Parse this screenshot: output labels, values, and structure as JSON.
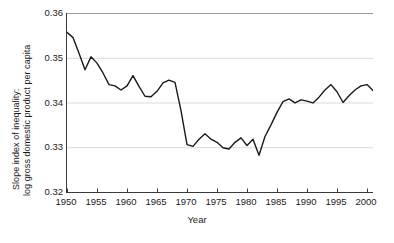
{
  "chart_data": {
    "type": "line",
    "title": "",
    "xlabel": "Year",
    "ylabel_lines": [
      "Slope index of inequality:",
      "log gross domestic product per capita"
    ],
    "ylabel": "Slope index of inequality: log gross domestic product per capita",
    "xlim": [
      1950,
      2001
    ],
    "ylim": [
      0.32,
      0.36
    ],
    "xticks": [
      1950,
      1955,
      1960,
      1965,
      1970,
      1975,
      1980,
      1985,
      1990,
      1995,
      2000
    ],
    "xtick_labels": [
      "1950",
      "1955",
      "1960",
      "1965",
      "1970",
      "1975",
      "1980",
      "1985",
      "1990",
      "1995",
      "2000"
    ],
    "yticks": [
      0.32,
      0.33,
      0.34,
      0.35,
      0.36
    ],
    "ytick_labels": [
      "0.32",
      "0.33",
      "0.34",
      "0.35",
      "0.36"
    ],
    "grid": "horizontal",
    "grid_color": "#d9d9d9",
    "legend": "none",
    "line_color": "#1a1a1a",
    "line_width": 1.4,
    "x": [
      1950,
      1951,
      1952,
      1953,
      1954,
      1955,
      1956,
      1957,
      1958,
      1959,
      1960,
      1961,
      1962,
      1963,
      1964,
      1965,
      1966,
      1967,
      1968,
      1969,
      1970,
      1971,
      1972,
      1973,
      1974,
      1975,
      1976,
      1977,
      1978,
      1979,
      1980,
      1981,
      1982,
      1983,
      1984,
      1985,
      1986,
      1987,
      1988,
      1989,
      1990,
      1991,
      1992,
      1993,
      1994,
      1995,
      1996,
      1997,
      1998,
      1999,
      2000,
      2001
    ],
    "values": [
      0.3557,
      0.3545,
      0.351,
      0.3473,
      0.3502,
      0.3488,
      0.3466,
      0.344,
      0.3437,
      0.3428,
      0.3437,
      0.346,
      0.3436,
      0.3414,
      0.3413,
      0.3425,
      0.3444,
      0.345,
      0.3445,
      0.3382,
      0.3306,
      0.3302,
      0.3318,
      0.333,
      0.3318,
      0.3311,
      0.3299,
      0.3296,
      0.3311,
      0.3321,
      0.3304,
      0.3318,
      0.3282,
      0.3324,
      0.335,
      0.3378,
      0.3402,
      0.3408,
      0.3399,
      0.3406,
      0.3403,
      0.3399,
      0.3412,
      0.3428,
      0.344,
      0.3424,
      0.34,
      0.3415,
      0.3428,
      0.3437,
      0.344,
      0.3427
    ],
    "series": [
      {
        "name": "Slope index of inequality",
        "values": [
          0.3557,
          0.3545,
          0.351,
          0.3473,
          0.3502,
          0.3488,
          0.3466,
          0.344,
          0.3437,
          0.3428,
          0.3437,
          0.346,
          0.3436,
          0.3414,
          0.3413,
          0.3425,
          0.3444,
          0.345,
          0.3445,
          0.3382,
          0.3306,
          0.3302,
          0.3318,
          0.333,
          0.3318,
          0.3311,
          0.3299,
          0.3296,
          0.3311,
          0.3321,
          0.3304,
          0.3318,
          0.3282,
          0.3324,
          0.335,
          0.3378,
          0.3402,
          0.3408,
          0.3399,
          0.3406,
          0.3403,
          0.3399,
          0.3412,
          0.3428,
          0.344,
          0.3424,
          0.34,
          0.3415,
          0.3428,
          0.3437,
          0.344,
          0.3427
        ]
      }
    ]
  }
}
